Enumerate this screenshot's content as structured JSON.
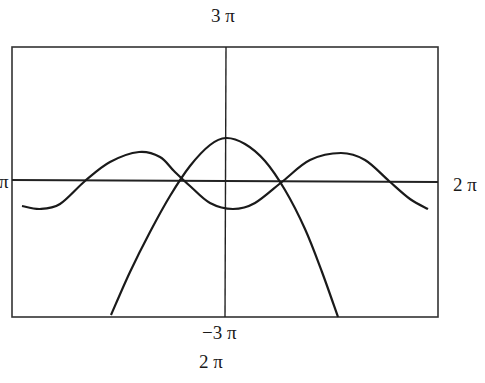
{
  "chart_data": {
    "type": "line",
    "title": "",
    "xlabel": "",
    "ylabel": "",
    "labels": {
      "top": "3 π",
      "bottom_tick": "−3 π",
      "bottom": "2 π",
      "right": "2 π",
      "left": "−2 π"
    },
    "xlim_label": [
      "−2 π",
      "2 π"
    ],
    "ylim_label": [
      "−3 π",
      "3 π"
    ],
    "grid": false,
    "axes_through_origin": true,
    "frame": true,
    "series": [
      {
        "name": "wave",
        "description": "oscillating curve, two maxima at x≈±π, minimum near x≈0 slightly below axis",
        "pixel_points": [
          [
            22,
            206
          ],
          [
            40,
            209
          ],
          [
            60,
            204
          ],
          [
            85,
            181
          ],
          [
            110,
            162
          ],
          [
            139,
            152
          ],
          [
            160,
            157
          ],
          [
            174,
            171
          ],
          [
            190,
            186
          ],
          [
            210,
            203
          ],
          [
            233,
            209
          ],
          [
            255,
            203
          ],
          [
            283,
            181
          ],
          [
            310,
            160
          ],
          [
            341,
            153
          ],
          [
            365,
            160
          ],
          [
            389,
            181
          ],
          [
            410,
            199
          ],
          [
            428,
            209
          ]
        ]
      },
      {
        "name": "parabola",
        "description": "downward-opening parabola, vertex slightly above axis at x≈0",
        "pixel_points": [
          [
            111,
            315
          ],
          [
            130,
            272
          ],
          [
            150,
            232
          ],
          [
            170,
            196
          ],
          [
            190,
            166
          ],
          [
            210,
            145
          ],
          [
            226,
            138
          ],
          [
            245,
            144
          ],
          [
            265,
            161
          ],
          [
            285,
            190
          ],
          [
            305,
            229
          ],
          [
            322,
            272
          ],
          [
            338,
            317
          ]
        ]
      }
    ]
  },
  "colors": {
    "line": "#1a1a1a",
    "frame": "#333333",
    "background": "#ffffff"
  }
}
